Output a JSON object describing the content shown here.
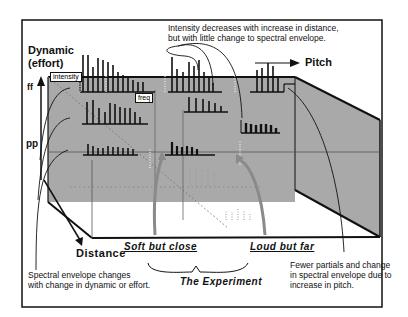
{
  "axes": {
    "dynamic_label_line1": "Dynamic",
    "dynamic_label_line2": "(effort)",
    "ff": "ff",
    "pp": "pp",
    "pitch": "Pitch",
    "distance": "Distance"
  },
  "boxes": {
    "intensity": "intensity",
    "freq": "freq"
  },
  "annotations": {
    "top_line1": "Intensity decreases with increase in distance,",
    "top_line2": "but with little change to spectral envelope.",
    "left_line1": "Spectral envelope changes",
    "left_line2": "with change in dynamic or effort.",
    "right_line1": "Fewer partials and change",
    "right_line2": "in spectral envelope due to",
    "right_line3": "increase in pitch."
  },
  "experiment": {
    "soft_close": "Soft but close",
    "loud_far": "Loud but far",
    "title": "The Experiment"
  },
  "colors": {
    "plane": "#a9a9a9",
    "ink": "#111111",
    "dotted": "#888888",
    "arrow_gray": "#8a8a8a"
  }
}
